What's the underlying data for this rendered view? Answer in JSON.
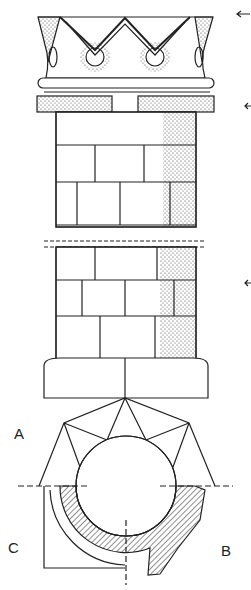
{
  "figure": {
    "labels": {
      "a": "A",
      "b": "B",
      "c": "C"
    },
    "arrows": 3,
    "ink_color": "#222222",
    "background": "#ffffff"
  }
}
